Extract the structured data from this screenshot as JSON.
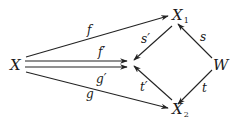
{
  "diagram": {
    "type": "commutative-diagram",
    "nodes": [
      {
        "id": "X",
        "label": "X",
        "subscript": ""
      },
      {
        "id": "X1",
        "label": "X",
        "subscript": "1"
      },
      {
        "id": "X2",
        "label": "X",
        "subscript": "2"
      },
      {
        "id": "W",
        "label": "W",
        "subscript": ""
      },
      {
        "id": "C",
        "label": "",
        "subscript": ""
      }
    ],
    "edges": [
      {
        "from": "X",
        "to": "X1",
        "label": "f"
      },
      {
        "from": "X",
        "to": "C",
        "label": "f′"
      },
      {
        "from": "X",
        "to": "C",
        "label": "g′"
      },
      {
        "from": "X",
        "to": "X2",
        "label": "g"
      },
      {
        "from": "X1",
        "to": "C",
        "label": "s′"
      },
      {
        "from": "X2",
        "to": "C",
        "label": "t′"
      },
      {
        "from": "W",
        "to": "X1",
        "label": "s"
      },
      {
        "from": "W",
        "to": "X2",
        "label": "t"
      }
    ]
  }
}
